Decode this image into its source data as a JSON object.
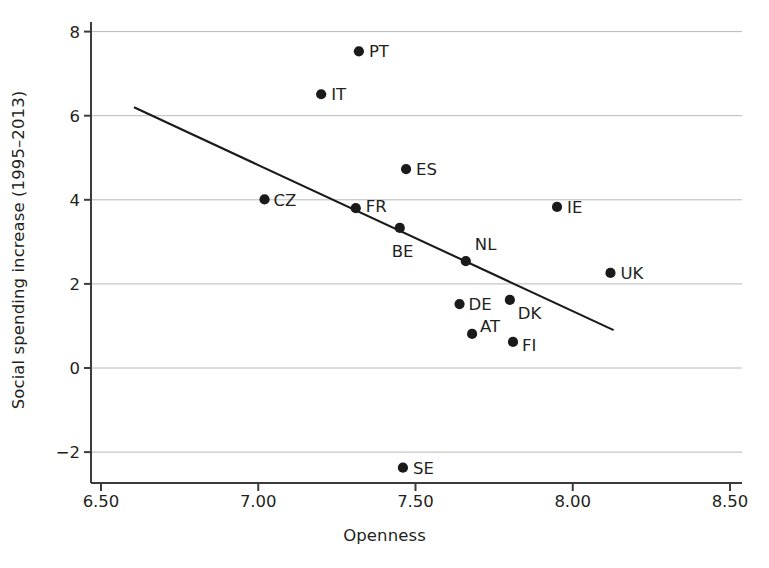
{
  "chart_data": {
    "type": "scatter",
    "title": "",
    "xlabel": "Openness",
    "ylabel": "Social spending increase (1995–2013)",
    "xlim": [
      6.4,
      8.56
    ],
    "ylim": [
      -2.75,
      8.28
    ],
    "xticks": [
      "6.50",
      "7.00",
      "7.50",
      "8.00",
      "8.50"
    ],
    "xtick_values": [
      6.5,
      7.0,
      7.5,
      8.0,
      8.5
    ],
    "yticks": [
      "8",
      "6",
      "4",
      "2",
      "0",
      "−2"
    ],
    "ytick_values": [
      8,
      6,
      4,
      2,
      0,
      -2
    ],
    "grid": "horizontal",
    "legend": "none",
    "marker_color": "#1a1a1a",
    "gridline_color": "#b8b8b8",
    "axis_color": "#3c3c3c",
    "points": [
      {
        "label": "PT",
        "x": 7.32,
        "y": 7.53
      },
      {
        "label": "IT",
        "x": 7.2,
        "y": 6.51
      },
      {
        "label": "ES",
        "x": 7.47,
        "y": 4.73
      },
      {
        "label": "CZ",
        "x": 7.02,
        "y": 4.01
      },
      {
        "label": "FR",
        "x": 7.31,
        "y": 3.8
      },
      {
        "label": "IE",
        "x": 7.95,
        "y": 3.83
      },
      {
        "label": "BE",
        "x": 7.45,
        "y": 3.33
      },
      {
        "label": "NL",
        "x": 7.66,
        "y": 2.54
      },
      {
        "label": "UK",
        "x": 8.12,
        "y": 2.26
      },
      {
        "label": "DK",
        "x": 7.8,
        "y": 1.62
      },
      {
        "label": "DE",
        "x": 7.64,
        "y": 1.52
      },
      {
        "label": "AT",
        "x": 7.68,
        "y": 0.81
      },
      {
        "label": "FI",
        "x": 7.81,
        "y": 0.62
      },
      {
        "label": "SE",
        "x": 7.46,
        "y": -2.37
      }
    ],
    "label_offsets": {
      "PT": {
        "dx": 10,
        "dy": 0
      },
      "IT": {
        "dx": 10,
        "dy": 0
      },
      "ES": {
        "dx": 10,
        "dy": 0
      },
      "CZ": {
        "dx": 9,
        "dy": 1
      },
      "FR": {
        "dx": 10,
        "dy": -2
      },
      "IE": {
        "dx": 10,
        "dy": 0
      },
      "BE": {
        "dx": -8,
        "dy": 23
      },
      "NL": {
        "dx": 9,
        "dy": -17
      },
      "UK": {
        "dx": 10,
        "dy": 0
      },
      "DK": {
        "dx": 8,
        "dy": 13
      },
      "DE": {
        "dx": 9,
        "dy": 0
      },
      "AT": {
        "dx": 8,
        "dy": -8
      },
      "FI": {
        "dx": 9,
        "dy": 3
      },
      "SE": {
        "dx": 10,
        "dy": 0
      }
    },
    "trendline": {
      "name": "fitted-regression-line",
      "x0": 6.605,
      "y0": 6.2,
      "x1": 8.13,
      "y1": 0.9
    }
  }
}
